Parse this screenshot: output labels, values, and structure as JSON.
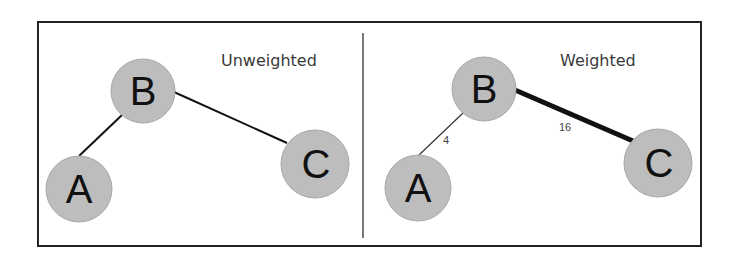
{
  "figure": {
    "border_color": "#222222",
    "divider_color": "#777777",
    "node_fill": "#bdbdbd",
    "edge_color": "#111111"
  },
  "panels": [
    {
      "title": "Unweighted",
      "nodes": [
        {
          "label": "A",
          "cx": 79,
          "cy": 189,
          "r": 33
        },
        {
          "label": "B",
          "cx": 143,
          "cy": 91,
          "r": 32
        },
        {
          "label": "C",
          "cx": 315,
          "cy": 164,
          "r": 34
        }
      ],
      "edges": [
        {
          "from": "A",
          "to": "B",
          "weight_label": null
        },
        {
          "from": "B",
          "to": "C",
          "weight_label": null
        }
      ]
    },
    {
      "title": "Weighted",
      "nodes": [
        {
          "label": "A",
          "cx": 418,
          "cy": 188,
          "r": 33
        },
        {
          "label": "B",
          "cx": 484,
          "cy": 89,
          "r": 32
        },
        {
          "label": "C",
          "cx": 658,
          "cy": 163,
          "r": 34
        }
      ],
      "edges": [
        {
          "from": "A",
          "to": "B",
          "weight_label": "4"
        },
        {
          "from": "B",
          "to": "C",
          "weight_label": "16"
        }
      ]
    }
  ]
}
